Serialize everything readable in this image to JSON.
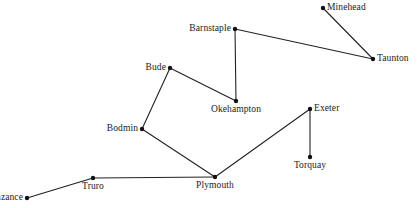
{
  "diagram": {
    "kind": "network-graph",
    "width": 417,
    "height": 208,
    "background_color": "#ffffff",
    "node_color": "#111111",
    "edge_color": "#222222",
    "label_color": "#1a1a1a",
    "nodes": [
      {
        "id": "minehead",
        "label": "Minehead",
        "x": 323,
        "y": 8,
        "label_pos": "right"
      },
      {
        "id": "taunton",
        "label": "Taunton",
        "x": 373,
        "y": 59,
        "label_pos": "right"
      },
      {
        "id": "barnstaple",
        "label": "Barnstaple",
        "x": 235,
        "y": 29,
        "label_pos": "left"
      },
      {
        "id": "okehampton",
        "label": "Okehampton",
        "x": 236,
        "y": 101,
        "label_pos": "below"
      },
      {
        "id": "bude",
        "label": "Bude",
        "x": 170,
        "y": 68,
        "label_pos": "left"
      },
      {
        "id": "bodmin",
        "label": "Bodmin",
        "x": 142,
        "y": 129,
        "label_pos": "left"
      },
      {
        "id": "exeter",
        "label": "Exeter",
        "x": 310,
        "y": 109,
        "label_pos": "right"
      },
      {
        "id": "torquay",
        "label": "Torquay",
        "x": 310,
        "y": 157,
        "label_pos": "below"
      },
      {
        "id": "plymouth",
        "label": "Plymouth",
        "x": 215,
        "y": 177,
        "label_pos": "below"
      },
      {
        "id": "truro",
        "label": "Truro",
        "x": 93,
        "y": 178,
        "label_pos": "below"
      },
      {
        "id": "penzance",
        "label": "Penzance",
        "x": 27,
        "y": 198,
        "label_pos": "left"
      }
    ],
    "edges": [
      {
        "id": "minehead-taunton",
        "from": "minehead",
        "to": "taunton"
      },
      {
        "id": "barnstaple-taunton",
        "from": "barnstaple",
        "to": "taunton"
      },
      {
        "id": "barnstaple-okehampton",
        "from": "barnstaple",
        "to": "okehampton"
      },
      {
        "id": "bude-okehampton",
        "from": "bude",
        "to": "okehampton"
      },
      {
        "id": "bude-bodmin",
        "from": "bude",
        "to": "bodmin"
      },
      {
        "id": "bodmin-plymouth",
        "from": "bodmin",
        "to": "plymouth"
      },
      {
        "id": "plymouth-exeter",
        "from": "plymouth",
        "to": "exeter"
      },
      {
        "id": "exeter-torquay",
        "from": "exeter",
        "to": "torquay"
      },
      {
        "id": "plymouth-truro",
        "from": "plymouth",
        "to": "truro"
      },
      {
        "id": "truro-penzance",
        "from": "truro",
        "to": "penzance"
      }
    ]
  }
}
